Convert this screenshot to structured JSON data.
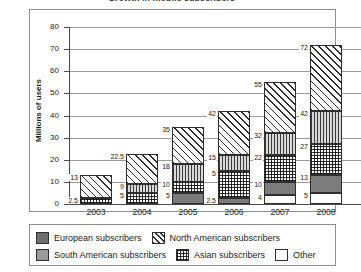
{
  "title_clipped": "Growth in mobile subscribers",
  "chart_data": {
    "type": "bar",
    "stacked": true,
    "title": "",
    "xlabel": "",
    "ylabel": "Millions of users",
    "ylim": [
      0,
      80
    ],
    "yticks": [
      0,
      10,
      20,
      30,
      40,
      50,
      60,
      70,
      80
    ],
    "grid": true,
    "legend_position": "bottom",
    "categories": [
      "2003",
      "2004",
      "2005",
      "2006",
      "2007",
      "2008"
    ],
    "series": [
      {
        "name": "Other",
        "pattern": "white",
        "cumulative_tops": [
          0,
          0,
          0,
          0,
          4,
          5
        ],
        "values": [
          0,
          0,
          0,
          0,
          4,
          5
        ]
      },
      {
        "name": "European subscribers",
        "pattern": "solid-gray",
        "cumulative_tops": [
          0,
          0,
          5,
          2.5,
          10,
          13
        ],
        "values": [
          0,
          0,
          5,
          2.5,
          6,
          8
        ]
      },
      {
        "name": "Asian subscribers",
        "pattern": "grid",
        "cumulative_tops": [
          2.5,
          5,
          10,
          15,
          22,
          27
        ],
        "values": [
          2.5,
          5,
          5,
          12.5,
          12,
          14
        ]
      },
      {
        "name": "South American subscribers",
        "pattern": "vertical-lines",
        "cumulative_tops": [
          2.5,
          9,
          18,
          22,
          32,
          42
        ],
        "values": [
          0,
          4,
          8,
          7,
          10,
          15
        ]
      },
      {
        "name": "North American subscribers",
        "pattern": "diagonal-hatch",
        "cumulative_tops": [
          13,
          22.5,
          35,
          42,
          55,
          72
        ],
        "values": [
          10.5,
          13.5,
          17,
          20,
          23,
          30
        ]
      }
    ],
    "point_labels": {
      "2003": [
        "2.5",
        "13"
      ],
      "2004": [
        "5",
        "9",
        "22.5"
      ],
      "2005": [
        "5",
        "10",
        "18",
        "35"
      ],
      "2006": [
        "2.5",
        "5",
        "15",
        "22",
        "42"
      ],
      "2007": [
        "4",
        "10",
        "22",
        "32",
        "55"
      ],
      "2008": [
        "5",
        "13",
        "27",
        "42",
        "72"
      ]
    }
  },
  "yaxis": {
    "title": "Millions of users",
    "ticks": [
      "0",
      "10",
      "20",
      "30",
      "40",
      "50",
      "60",
      "70",
      "80"
    ]
  },
  "xaxis": {
    "ticks": [
      "2003",
      "2004",
      "2005",
      "2006",
      "2007",
      "2008"
    ]
  },
  "legend": {
    "row1": [
      {
        "label": "European subscribers",
        "swatch": "european-swatch"
      },
      {
        "label": "North American subscribers",
        "swatch": "north-american-swatch"
      }
    ],
    "row2": [
      {
        "label": "South American subscribers",
        "swatch": "south-american-swatch"
      },
      {
        "label": "Asian subscribers",
        "swatch": "asian-swatch"
      },
      {
        "label": "Other",
        "swatch": "other-swatch"
      }
    ]
  },
  "bars": [
    {
      "year": "2003",
      "segments": [
        {
          "series": "Asian subscribers",
          "cls": "asian",
          "from": 0,
          "to": 2.5,
          "label": "2.5"
        },
        {
          "series": "North American subscribers",
          "cls": "northam",
          "from": 2.5,
          "to": 13,
          "label": "13"
        }
      ]
    },
    {
      "year": "2004",
      "segments": [
        {
          "series": "Asian subscribers",
          "cls": "asian",
          "from": 0,
          "to": 5,
          "label": "5"
        },
        {
          "series": "South American subscribers",
          "cls": "southam",
          "from": 5,
          "to": 9,
          "label": "9"
        },
        {
          "series": "North American subscribers",
          "cls": "northam",
          "from": 9,
          "to": 22.5,
          "label": "22.5"
        }
      ]
    },
    {
      "year": "2005",
      "segments": [
        {
          "series": "European subscribers",
          "cls": "european",
          "from": 0,
          "to": 5,
          "label": "5"
        },
        {
          "series": "Asian subscribers",
          "cls": "asian",
          "from": 5,
          "to": 10,
          "label": "10"
        },
        {
          "series": "South American subscribers",
          "cls": "southam",
          "from": 10,
          "to": 18,
          "label": "18"
        },
        {
          "series": "North American subscribers",
          "cls": "northam",
          "from": 18,
          "to": 35,
          "label": "35"
        }
      ]
    },
    {
      "year": "2006",
      "segments": [
        {
          "series": "European subscribers",
          "cls": "european",
          "from": 0,
          "to": 2.5,
          "label": "2.5"
        },
        {
          "series": "Asian subscribers",
          "cls": "asian",
          "from": 2.5,
          "to": 15,
          "label": "5"
        },
        {
          "series": "South American subscribers",
          "cls": "southam",
          "from": 15,
          "to": 22,
          "label": "15"
        },
        {
          "series": "North American subscribers",
          "cls": "northam",
          "from": 22,
          "to": 42,
          "label": "42"
        }
      ]
    },
    {
      "year": "2007",
      "segments": [
        {
          "series": "Other",
          "cls": "other",
          "from": 0,
          "to": 4,
          "label": "4"
        },
        {
          "series": "European subscribers",
          "cls": "european",
          "from": 4,
          "to": 10,
          "label": "10"
        },
        {
          "series": "Asian subscribers",
          "cls": "asian",
          "from": 10,
          "to": 22,
          "label": "22"
        },
        {
          "series": "South American subscribers",
          "cls": "southam",
          "from": 22,
          "to": 32,
          "label": "32"
        },
        {
          "series": "North American subscribers",
          "cls": "northam",
          "from": 32,
          "to": 55,
          "label": "55"
        }
      ]
    },
    {
      "year": "2008",
      "segments": [
        {
          "series": "Other",
          "cls": "other",
          "from": 0,
          "to": 5,
          "label": "5"
        },
        {
          "series": "European subscribers",
          "cls": "european",
          "from": 5,
          "to": 13,
          "label": "13"
        },
        {
          "series": "Asian subscribers",
          "cls": "asian",
          "from": 13,
          "to": 27,
          "label": "27"
        },
        {
          "series": "South American subscribers",
          "cls": "southam",
          "from": 27,
          "to": 42,
          "label": "42"
        },
        {
          "series": "North American subscribers",
          "cls": "northam",
          "from": 42,
          "to": 72,
          "label": "72"
        }
      ]
    }
  ]
}
